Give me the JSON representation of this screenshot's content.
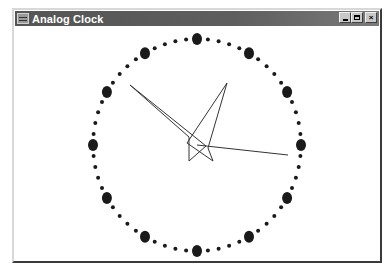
{
  "window": {
    "title": "Analog Clock",
    "icon": "app-window-icon",
    "controls": {
      "minimize": "minimize-icon",
      "maximize": "maximize-icon",
      "close_glyph": "×"
    }
  },
  "clock": {
    "center": [
      197,
      143
    ],
    "radius_x": 104,
    "radius_y": 106,
    "hour_marker_radius": 5,
    "minute_marker_radius": 2,
    "marker_color": "#1a1a1a",
    "hand_color": "#333333",
    "hands": {
      "hour": {
        "points": [
          [
            227,
            81
          ],
          [
            208,
            146
          ],
          [
            213,
            159
          ],
          [
            187,
            141
          ]
        ]
      },
      "minute": {
        "points": [
          [
            130,
            83
          ],
          [
            206,
            144
          ],
          [
            189,
            159
          ],
          [
            189,
            135
          ]
        ]
      },
      "second": {
        "from": [
          197,
          143
        ],
        "to": [
          288,
          153
        ]
      }
    }
  }
}
